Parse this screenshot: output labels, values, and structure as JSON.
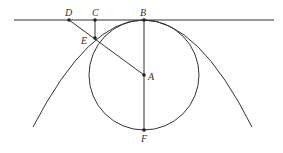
{
  "diagram": {
    "type": "geometry",
    "colors": {
      "stroke": "#333333",
      "background": "#ffffff"
    },
    "points": {
      "A": {
        "label": "A",
        "x": 144,
        "y": 75
      },
      "B": {
        "label": "B",
        "x": 144,
        "y": 20
      },
      "C": {
        "label": "C",
        "x": 95,
        "y": 20
      },
      "D": {
        "label": "D",
        "x": 69,
        "y": 20
      },
      "E": {
        "label": "E",
        "x": 95,
        "y": 38
      },
      "F": {
        "label": "F",
        "x": 144,
        "y": 130
      }
    },
    "segments": [
      [
        "D",
        "A"
      ],
      [
        "C",
        "E"
      ],
      [
        "B",
        "F"
      ]
    ],
    "circle": {
      "center": "A",
      "radius": 55
    },
    "tangent_line": {
      "y": 20,
      "x1": 14,
      "x2": 274
    },
    "parabola": {
      "vertex": "B",
      "left_end": [
        33,
        127
      ],
      "right_end": [
        252,
        127
      ]
    }
  }
}
